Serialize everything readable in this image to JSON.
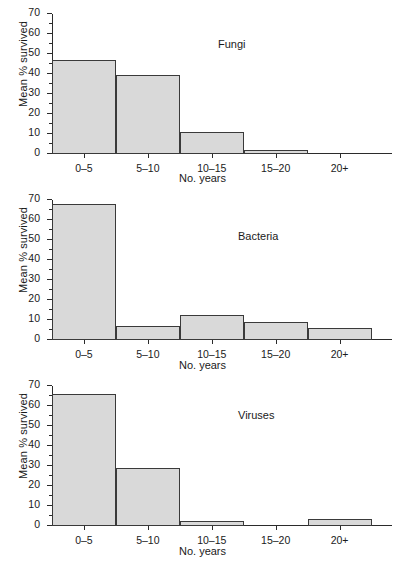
{
  "chart_data": [
    {
      "type": "bar",
      "title": "Fungi",
      "xlabel": "No. years",
      "ylabel": "Mean % survived",
      "categories": [
        "0–5",
        "5–10",
        "10–15",
        "15–20",
        "20+"
      ],
      "values": [
        47,
        39.5,
        11,
        2,
        0
      ],
      "ylim": [
        0,
        70
      ],
      "yticks": [
        0,
        10,
        20,
        30,
        40,
        50,
        60,
        70
      ],
      "ytick_labels": [
        "0",
        "10",
        "20",
        "30",
        "40",
        "50",
        "60",
        "70"
      ],
      "ytick_minor_step": 5,
      "grid": false,
      "legend": false
    },
    {
      "type": "bar",
      "title": "Bacteria",
      "xlabel": "No. years",
      "ylabel": "Mean % survived",
      "categories": [
        "0–5",
        "5–10",
        "10–15",
        "15–20",
        "20+"
      ],
      "values": [
        68,
        7,
        12.5,
        9,
        6
      ],
      "ylim": [
        0,
        70
      ],
      "yticks": [
        0,
        10,
        20,
        30,
        40,
        50,
        60,
        70
      ],
      "ytick_labels": [
        "0",
        "10",
        "20",
        "30",
        "40",
        "50",
        "60",
        "70"
      ],
      "ytick_minor_step": 5,
      "grid": false,
      "legend": false
    },
    {
      "type": "bar",
      "title": "Viruses",
      "xlabel": "No. years",
      "ylabel": "Mean % survived",
      "categories": [
        "0–5",
        "5–10",
        "10–15",
        "15–20",
        "20+"
      ],
      "values": [
        66,
        29,
        2.5,
        0,
        3.5
      ],
      "ylim": [
        0,
        70
      ],
      "yticks": [
        0,
        10,
        20,
        30,
        40,
        50,
        60,
        70
      ],
      "ytick_labels": [
        "0",
        "10",
        "20",
        "30",
        "40",
        "50",
        "60",
        "70"
      ],
      "ytick_minor_step": 5,
      "grid": false,
      "legend": false
    }
  ],
  "style": {
    "bar_fill": "#d9d9d9",
    "bar_stroke": "#3a3a3a",
    "axis_color": "#2b2b2b",
    "text_color": "#1a1a1a",
    "background": "#ffffff"
  }
}
